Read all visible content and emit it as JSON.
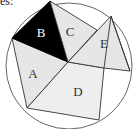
{
  "caption": "es:",
  "diagram": {
    "type": "geometric figure",
    "colors": {
      "background": "#ffffff",
      "stroke": "#333333",
      "circle_stroke": "#555555",
      "region_light": "#e6e6e6",
      "region_lighter": "#eeeeee",
      "region_dark": "#000000"
    },
    "regions": [
      {
        "label": "A",
        "fill": "#e6e6e6"
      },
      {
        "label": "B",
        "fill": "#000000"
      },
      {
        "label": "C",
        "fill": "#e6e6e6"
      },
      {
        "label": "D",
        "fill": "#eeeeee"
      },
      {
        "label": "E",
        "fill": "#e6e6e6"
      }
    ]
  }
}
